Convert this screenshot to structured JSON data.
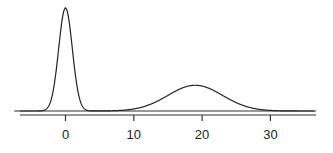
{
  "chart_data": {
    "type": "line",
    "title": "",
    "xlabel": "",
    "ylabel": "",
    "xlim": [
      -7.5,
      36.5
    ],
    "xticks": [
      0,
      10,
      20,
      30
    ],
    "xtick_labels": [
      "0",
      "10",
      "20",
      "30"
    ],
    "grid": false,
    "legend": null,
    "series": [
      {
        "name": "density",
        "components": [
          {
            "mean": 0,
            "sd": 1.0,
            "relative_peak_height": 1.0
          },
          {
            "mean": 19,
            "sd": 4.0,
            "relative_peak_height": 0.25
          }
        ]
      }
    ],
    "colors": {
      "line": "#222222",
      "axis": "#222222"
    }
  }
}
